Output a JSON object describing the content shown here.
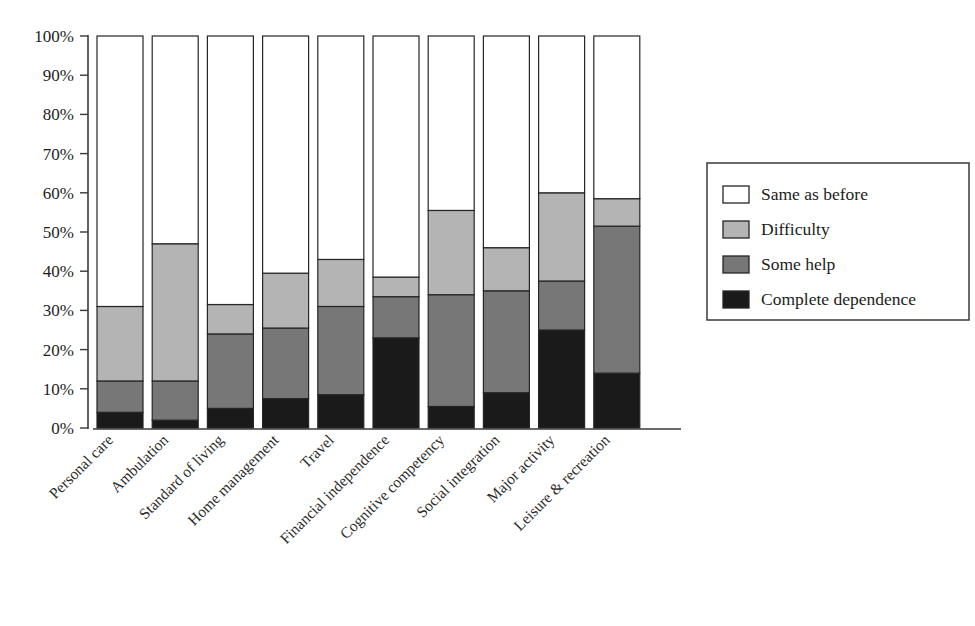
{
  "chart_data": {
    "type": "bar",
    "subtype": "stacked-bar-100-percent",
    "title": "",
    "xlabel": "",
    "ylabel": "",
    "ylim": [
      0,
      100
    ],
    "grid": false,
    "legend_position": "right",
    "y_tick_labels": [
      "100%",
      "90%",
      "80%",
      "70%",
      "60%",
      "50%",
      "40%",
      "30%",
      "20%",
      "10%",
      "0%"
    ],
    "y_tick_values": [
      100,
      90,
      80,
      70,
      60,
      50,
      40,
      30,
      20,
      10,
      0
    ],
    "categories": [
      "Personal care",
      "Ambulation",
      "Standard of living",
      "Home management",
      "Travel",
      "Financial independence",
      "Cognitive competency",
      "Social integration",
      "Major activity",
      "Leisure & recreation"
    ],
    "series": [
      {
        "name": "Complete dependence",
        "color": "#1a1a1a",
        "values": [
          4,
          2,
          5,
          7.5,
          8.5,
          23,
          5.5,
          9,
          25,
          14
        ]
      },
      {
        "name": "Some help",
        "color": "#777777",
        "values": [
          8,
          10,
          19,
          18,
          22.5,
          10.5,
          28.5,
          26,
          12.5,
          37.5
        ]
      },
      {
        "name": "Difficulty",
        "color": "#b4b4b4",
        "values": [
          19,
          35,
          7.5,
          14,
          12,
          5,
          21.5,
          11,
          22.5,
          7
        ]
      },
      {
        "name": "Same as before",
        "color": "#ffffff",
        "values": [
          69,
          53,
          68.5,
          60.5,
          57,
          61.5,
          44.5,
          54,
          40,
          41.5
        ]
      }
    ],
    "cumulative_tops": {
      "Personal care": [
        4,
        12,
        31,
        100
      ],
      "Ambulation": [
        2,
        12,
        47,
        100
      ],
      "Standard of living": [
        5,
        24,
        31.5,
        100
      ],
      "Home management": [
        7.5,
        25.5,
        39.5,
        100
      ],
      "Travel": [
        8.5,
        31,
        43,
        100
      ],
      "Financial independence": [
        23,
        33.5,
        38.5,
        100
      ],
      "Cognitive competency": [
        5.5,
        34,
        55.5,
        100
      ],
      "Social integration": [
        9,
        35,
        46,
        100
      ],
      "Major activity": [
        25,
        37.5,
        60,
        100
      ],
      "Leisure & recreation": [
        14,
        51.5,
        58.5,
        100
      ]
    }
  },
  "legend": {
    "items": [
      {
        "label": "Same as before",
        "color": "#ffffff"
      },
      {
        "label": "Difficulty",
        "color": "#b4b4b4"
      },
      {
        "label": "Some help",
        "color": "#777777"
      },
      {
        "label": "Complete dependence",
        "color": "#1a1a1a"
      }
    ]
  }
}
